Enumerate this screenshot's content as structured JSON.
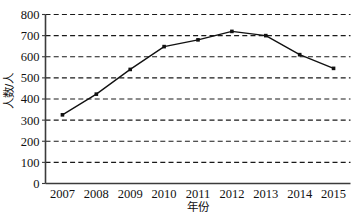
{
  "chart_data": {
    "type": "line",
    "title": "",
    "subtitle": "",
    "xlabel": "年份",
    "ylabel": "人数/人",
    "categories": [
      "2007",
      "2008",
      "2009",
      "2010",
      "2011",
      "2012",
      "2013",
      "2014",
      "2015"
    ],
    "values": [
      325,
      423,
      540,
      648,
      680,
      720,
      700,
      610,
      545
    ],
    "series": [
      {
        "name": "人数/人",
        "values": [
          325,
          423,
          540,
          648,
          680,
          720,
          700,
          610,
          545
        ]
      }
    ],
    "ylim": [
      0,
      800
    ],
    "yticks": [
      0,
      100,
      200,
      300,
      400,
      500,
      600,
      700,
      800
    ],
    "ytick_labels": [
      "0",
      "100",
      "200",
      "300",
      "400",
      "500",
      "600",
      "700",
      "800"
    ],
    "xtick_labels": [
      "2007",
      "2008",
      "2009",
      "2010",
      "2011",
      "2012",
      "2013",
      "2014",
      "2015"
    ],
    "grid": true,
    "grid_axis": "y",
    "grid_style": "dashed",
    "grid_color": "#1a1a1a",
    "legend": false,
    "legend_position": "none",
    "line_color": "#111111",
    "marker": "square",
    "marker_color": "#111111",
    "axis_color": "#3b3b3b",
    "background": "#ffffff"
  },
  "axes": {
    "y_labels": [
      "800",
      "700",
      "600",
      "500",
      "400",
      "300",
      "200",
      "100",
      "0"
    ],
    "y_title": "人数/人",
    "x_title": "年份",
    "x_labels": [
      "2007",
      "2008",
      "2009",
      "2010",
      "2011",
      "2012",
      "2013",
      "2014",
      "2015"
    ]
  }
}
